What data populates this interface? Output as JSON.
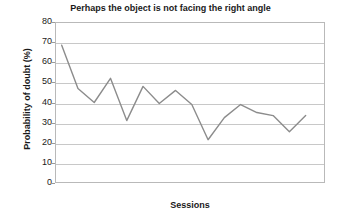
{
  "chart_data": {
    "type": "line",
    "title": "Perhaps the object is not facing the right angle",
    "xlabel": "Sessions",
    "ylabel": "Probability of doubt (%)",
    "ylim": [
      0,
      80
    ],
    "ytick_labels": [
      "80",
      "70",
      "60",
      "50",
      "40",
      "30",
      "20",
      "10",
      "0"
    ],
    "yticks": [
      80,
      70,
      60,
      50,
      40,
      30,
      20,
      10,
      0
    ],
    "xtick_labels": [],
    "grid": true,
    "legend": false,
    "legend_position": "none",
    "line_color": "#8c8c8c",
    "x": [
      1,
      2,
      3,
      4,
      5,
      6,
      7,
      8,
      9,
      10,
      11,
      12,
      13,
      14,
      15,
      16
    ],
    "series": [
      {
        "name": "Probability of doubt",
        "values": [
          69,
          47.5,
          40.5,
          52.5,
          31.5,
          48.5,
          40,
          46.5,
          39.5,
          22,
          33,
          39.5,
          35.5,
          34,
          26,
          34
        ]
      }
    ]
  },
  "axis": {
    "y_label_text": "Probability of doubt (%)",
    "x_label_text": "Sessions"
  }
}
